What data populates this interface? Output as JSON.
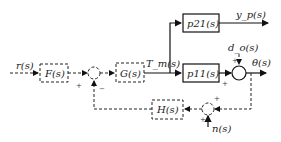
{
  "diagram": {
    "type": "control-block-diagram",
    "signals": {
      "reference": "r(s)",
      "torque": "T_m(s)",
      "output_p": "y_p(s)",
      "disturbance": "d_o(s)",
      "output": "θ(s)",
      "noise": "n(s)"
    },
    "blocks": {
      "prefilter": "F(s)",
      "controller": "G(s)",
      "plant_21": "p21(s)",
      "plant_11": "p11(s)",
      "feedback": "H(s)"
    },
    "signs": {
      "sum1_plus": "+",
      "sum1_minus": "−",
      "sum2_plus_left": "+",
      "sum2_plus_top": "+",
      "sum3_plus_top": "+",
      "sum3_plus_bottom": "+"
    }
  }
}
